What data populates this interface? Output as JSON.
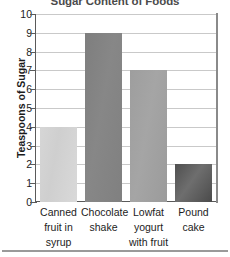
{
  "chart_data": {
    "type": "bar",
    "title": "Sugar Content of Foods",
    "xlabel": "",
    "ylabel": "Teaspoons of Sugar",
    "categories": [
      "Canned fruit in syrup",
      "Chocolate shake",
      "Lowfat yogurt with fruit",
      "Pound cake"
    ],
    "category_lines": [
      [
        "Canned",
        "fruit in",
        "syrup"
      ],
      [
        "Chocolate",
        "shake"
      ],
      [
        "Lowfat",
        "yogurt",
        "with fruit"
      ],
      [
        "Pound",
        "cake"
      ]
    ],
    "values": [
      4,
      9,
      7,
      2
    ],
    "ylim": [
      0,
      10
    ],
    "ytick_step": 1,
    "yticks": [
      "10",
      "9",
      "8",
      "7",
      "6",
      "5",
      "4",
      "3",
      "2",
      "1",
      "0"
    ],
    "grid": true,
    "legend": false,
    "bar_colors": [
      "#d4d4d4",
      "#828282",
      "#a0a0a0",
      "#565656"
    ],
    "gridline_color": "#c9c9c9",
    "axis_color": "#5a5a5a"
  }
}
